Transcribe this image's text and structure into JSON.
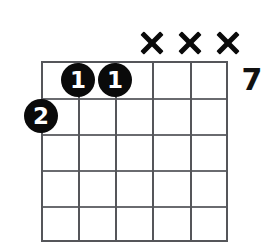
{
  "diagram": {
    "type": "guitar-chord-diagram",
    "title": "",
    "background_color": "#ffffff",
    "line_color": "#55565a",
    "dot_color": "#0a0a0a",
    "dot_text_color": "#ffffff",
    "mark_color": "#0a0a0a",
    "string_count": 6,
    "fret_rows": 5,
    "starting_fret_label": "7",
    "grid": {
      "left": 41,
      "top": 61,
      "right": 228,
      "bottom": 242,
      "string_x": [
        41,
        78,
        115,
        152,
        190,
        228
      ],
      "fret_y": [
        61,
        98,
        134,
        170,
        206,
        242
      ]
    },
    "finger_dots": [
      {
        "label": "1",
        "string": 2,
        "fret": 1,
        "x": 78,
        "y": 80
      },
      {
        "label": "1",
        "string": 3,
        "fret": 1,
        "x": 115,
        "y": 80
      },
      {
        "label": "2",
        "string": 1,
        "fret": 2,
        "x": 41,
        "y": 116
      }
    ],
    "muted_strings": [
      {
        "label": "X",
        "string": 4,
        "x": 152,
        "y": 43
      },
      {
        "label": "X",
        "string": 5,
        "x": 190,
        "y": 43
      },
      {
        "label": "X",
        "string": 6,
        "x": 228,
        "y": 43
      }
    ],
    "fret_marker": {
      "label": "7",
      "x": 252,
      "y": 80
    }
  }
}
